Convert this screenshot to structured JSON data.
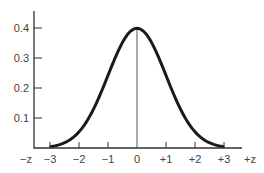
{
  "chart_data": {
    "type": "line",
    "title": "",
    "xlabel": "z",
    "ylabel": "",
    "x_tick_labels": [
      "−z",
      "−3",
      "−2",
      "−1",
      "0",
      "+1",
      "+2",
      "+3",
      "+z"
    ],
    "x_ticks": [
      -3,
      -2,
      -1,
      0,
      1,
      2,
      3
    ],
    "y_tick_labels": [
      "0.1",
      "0.2",
      "0.3",
      "0.4"
    ],
    "y_ticks": [
      0.1,
      0.2,
      0.3,
      0.4
    ],
    "xlim": [
      -3.6,
      3.6
    ],
    "ylim": [
      0,
      0.45
    ],
    "grid": false,
    "legend": null,
    "series": [
      {
        "name": "standard normal density",
        "x": [
          -3,
          -2.5,
          -2,
          -1.5,
          -1,
          -0.5,
          0,
          0.5,
          1,
          1.5,
          2,
          2.5,
          3
        ],
        "y": [
          0.004,
          0.018,
          0.054,
          0.13,
          0.242,
          0.352,
          0.399,
          0.352,
          0.242,
          0.13,
          0.054,
          0.018,
          0.004
        ]
      }
    ],
    "annotations": [
      "vertical line at z = 0 from axis to peak"
    ]
  }
}
